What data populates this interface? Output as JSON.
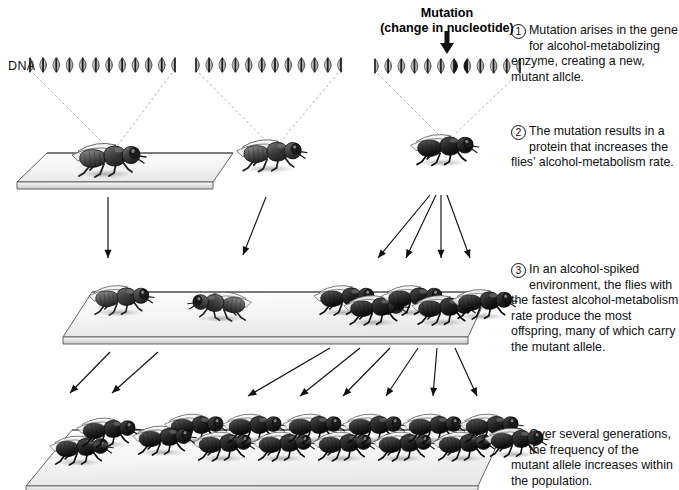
{
  "figure": {
    "background": "#ffffff",
    "ink": "#111111"
  },
  "labels": {
    "dna": "DNA",
    "mutation_title": "Mutation",
    "mutation_subtitle": "(change in nucleotide)"
  },
  "steps": [
    {
      "number": "1",
      "text": "Mutation arises in the gene for alcohol-metabolizing enzyme, creating a new, mutant allcle."
    },
    {
      "number": "2",
      "text": "The mutation results in a protein that increases the flies’ alcohol-metabolism rate."
    },
    {
      "number": "3",
      "text": "In an alcohol-spiked environment, the flies with the fastest alcohol-metabolism rate produce the most offspring, many of which carry the mutant allele."
    },
    {
      "number": "4",
      "text": "Over several generations, the frequency of the mutant allele increases within the population."
    }
  ],
  "dna_strands": [
    {
      "id": "dna-strand-left",
      "x": 30,
      "y": 57,
      "width": 145,
      "mutated": false
    },
    {
      "id": "dna-strand-middle",
      "x": 196,
      "y": 57,
      "width": 145,
      "mutated": false
    },
    {
      "id": "dna-strand-right",
      "x": 375,
      "y": 58,
      "width": 145,
      "mutated": true,
      "mutation_index": 6
    }
  ],
  "platforms": [
    {
      "id": "platform-generation-1",
      "label": "generation 1 slab",
      "fly_count": 3
    },
    {
      "id": "platform-generation-2",
      "label": "generation 2 slab",
      "fly_count": 7
    },
    {
      "id": "platform-generation-3",
      "label": "generation 3 slab",
      "fly_count": 15
    }
  ],
  "flies": {
    "row1": [
      {
        "x": 62,
        "y": 133,
        "scale": 1.0,
        "flip": false,
        "dark": false
      },
      {
        "x": 225,
        "y": 128,
        "scale": 0.95,
        "flip": false,
        "dark": false
      },
      {
        "x": 398,
        "y": 122,
        "scale": 0.92,
        "flip": false,
        "dark": true
      }
    ],
    "row2": [
      {
        "x": 75,
        "y": 272,
        "scale": 0.88,
        "flip": false,
        "dark": false
      },
      {
        "x": 180,
        "y": 278,
        "scale": 0.86,
        "flip": true,
        "dark": false
      },
      {
        "x": 300,
        "y": 272,
        "scale": 0.88,
        "flip": false,
        "dark": true
      },
      {
        "x": 330,
        "y": 282,
        "scale": 0.88,
        "flip": false,
        "dark": true
      },
      {
        "x": 368,
        "y": 272,
        "scale": 0.88,
        "flip": false,
        "dark": true
      },
      {
        "x": 398,
        "y": 282,
        "scale": 0.88,
        "flip": false,
        "dark": true
      },
      {
        "x": 438,
        "y": 276,
        "scale": 0.88,
        "flip": false,
        "dark": true
      }
    ],
    "row3": [
      {
        "x": 35,
        "y": 422,
        "scale": 0.86,
        "flip": false,
        "dark": true
      },
      {
        "x": 62,
        "y": 404,
        "scale": 0.86,
        "flip": false,
        "dark": true
      },
      {
        "x": 150,
        "y": 400,
        "scale": 0.86,
        "flip": false,
        "dark": true
      },
      {
        "x": 178,
        "y": 418,
        "scale": 0.86,
        "flip": false,
        "dark": true
      },
      {
        "x": 208,
        "y": 400,
        "scale": 0.86,
        "flip": false,
        "dark": true
      },
      {
        "x": 238,
        "y": 418,
        "scale": 0.86,
        "flip": false,
        "dark": true
      },
      {
        "x": 268,
        "y": 400,
        "scale": 0.86,
        "flip": false,
        "dark": true
      },
      {
        "x": 298,
        "y": 418,
        "scale": 0.86,
        "flip": false,
        "dark": true
      },
      {
        "x": 328,
        "y": 400,
        "scale": 0.86,
        "flip": false,
        "dark": true
      },
      {
        "x": 358,
        "y": 418,
        "scale": 0.86,
        "flip": false,
        "dark": true
      },
      {
        "x": 388,
        "y": 400,
        "scale": 0.86,
        "flip": false,
        "dark": true
      },
      {
        "x": 418,
        "y": 418,
        "scale": 0.86,
        "flip": false,
        "dark": true
      },
      {
        "x": 445,
        "y": 400,
        "scale": 0.86,
        "flip": false,
        "dark": true
      },
      {
        "x": 118,
        "y": 412,
        "scale": 0.86,
        "flip": false,
        "dark": true
      },
      {
        "x": 470,
        "y": 414,
        "scale": 0.86,
        "flip": false,
        "dark": true
      }
    ]
  }
}
